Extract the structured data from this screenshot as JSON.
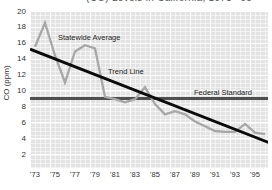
{
  "clipped_top_text": "(CO) Levels in California, 1973–’95",
  "colors": {
    "plot_background": "#e3e3e3",
    "grid": "#ffffff",
    "statewide_average_line": "#a7a7a7",
    "trend_line": "#0b0b0b",
    "federal_standard_line": "#4f4f4f",
    "text": "#222222"
  },
  "chart_data": {
    "type": "line",
    "title": "",
    "xlabel": "",
    "ylabel": "CO (ppm)",
    "ylim": [
      0,
      20
    ],
    "grid": true,
    "yticks": [
      20,
      18,
      16,
      14,
      12,
      10,
      8,
      6,
      4,
      2
    ],
    "xticks": [
      "'73",
      "'75",
      "'77",
      "'79",
      "'81",
      "'83",
      "'85",
      "'87",
      "'89",
      "'91",
      "'93",
      "'95"
    ],
    "xtick_years": [
      1973,
      1975,
      1977,
      1979,
      1981,
      1983,
      1985,
      1987,
      1989,
      1991,
      1993,
      1995
    ],
    "series": [
      {
        "name": "Federal Standard",
        "color": "#4f4f4f",
        "width": 2.8,
        "years": [
          1972.5,
          1996.7
        ],
        "values": [
          9,
          9
        ]
      },
      {
        "name": "Statewide Average",
        "color": "#a7a7a7",
        "width": 2.3,
        "years": [
          1973,
          1974,
          1975,
          1976,
          1977,
          1978,
          1979,
          1980,
          1981,
          1982,
          1983,
          1984,
          1985,
          1986,
          1987,
          1988,
          1989,
          1990,
          1991,
          1992,
          1993,
          1994,
          1995,
          1996
        ],
        "values": [
          15.5,
          18.5,
          14.4,
          11.0,
          14.9,
          15.7,
          15.3,
          9.2,
          8.9,
          8.5,
          8.9,
          10.4,
          8.3,
          7.0,
          7.4,
          7.0,
          6.1,
          5.5,
          4.9,
          4.8,
          4.8,
          5.8,
          4.7,
          4.5
        ]
      },
      {
        "name": "Trend Line",
        "color": "#0b0b0b",
        "width": 3,
        "years": [
          1972.5,
          1996.7
        ],
        "values": [
          15.2,
          3.3
        ]
      }
    ],
    "annotations": [
      {
        "text": "Statewide Average",
        "x": 58,
        "y": 33
      },
      {
        "text": "Trend Line",
        "x": 108,
        "y": 67
      },
      {
        "text": "Federal Standard",
        "x": 194,
        "y": 88
      }
    ]
  }
}
